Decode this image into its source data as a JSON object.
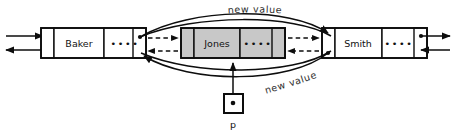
{
  "diagram": {
    "background_color": "#ffffff",
    "stroke_color": "#0d0d0d",
    "shaded_fill": "#c8c8c8",
    "nodes": [
      {
        "id": "baker",
        "name": "Baker",
        "data_label": "Baker",
        "pointer_glyph": "••••",
        "shaded": false,
        "state": "existing"
      },
      {
        "id": "jones",
        "name": "Jones",
        "data_label": "Jones",
        "pointer_glyph": "••••",
        "shaded": true,
        "state": "new-node"
      },
      {
        "id": "smith",
        "name": "Smith",
        "data_label": "Smith",
        "pointer_glyph": "••••",
        "shaded": false,
        "state": "existing"
      }
    ],
    "pointer_variable": {
      "name": "p",
      "label": "p",
      "target": "jones"
    },
    "annotations": [
      {
        "id": "new-value-top",
        "text": "new  value",
        "position": "top",
        "describes": "baker-next-pointer"
      },
      {
        "id": "new-value-bottom",
        "text": "new  value",
        "position": "bottom",
        "describes": "smith-prev-pointer"
      }
    ],
    "links": {
      "old_links": [
        {
          "from": "baker",
          "to": "smith",
          "style": "solid-curve",
          "direction": "forward"
        },
        {
          "from": "smith",
          "to": "baker",
          "style": "solid-curve",
          "direction": "backward"
        }
      ],
      "new_links": [
        {
          "from": "baker",
          "to": "jones",
          "style": "dashed",
          "direction": "forward"
        },
        {
          "from": "jones",
          "to": "baker",
          "style": "dashed",
          "direction": "backward"
        },
        {
          "from": "jones",
          "to": "smith",
          "style": "dashed",
          "direction": "forward"
        },
        {
          "from": "smith",
          "to": "jones",
          "style": "dashed",
          "direction": "backward"
        }
      ]
    }
  }
}
